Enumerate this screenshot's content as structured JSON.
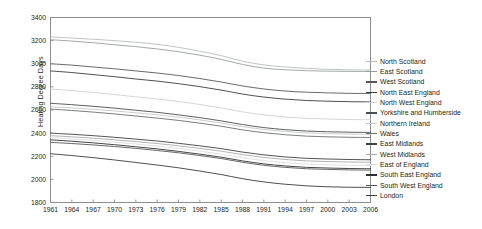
{
  "chart_data": {
    "type": "line",
    "title": "",
    "xlabel": "",
    "ylabel": "Heating Degree Days",
    "xlim": [
      1961,
      2006
    ],
    "ylim": [
      1800,
      3400
    ],
    "xticks": [
      1961,
      1964,
      1967,
      1970,
      1973,
      1976,
      1979,
      1982,
      1985,
      1988,
      1991,
      1994,
      1997,
      2000,
      2003,
      2006
    ],
    "yticks": [
      1800,
      2000,
      2200,
      2400,
      2600,
      2800,
      3000,
      3200,
      3400
    ],
    "grid": false,
    "legend_position": "right",
    "x": [
      1961,
      1964,
      1967,
      1970,
      1973,
      1976,
      1979,
      1982,
      1985,
      1988,
      1991,
      1994,
      1997,
      2000,
      2003,
      2006
    ],
    "series": [
      {
        "name": "North Scotland",
        "color": "#b9bcbe",
        "values": [
          3232,
          3222,
          3212,
          3200,
          3186,
          3168,
          3142,
          3108,
          3070,
          3022,
          2990,
          2972,
          2960,
          2952,
          2948,
          2946
        ]
      },
      {
        "name": "East Scotland",
        "color": "#9a9d9f",
        "values": [
          3208,
          3196,
          3182,
          3164,
          3148,
          3128,
          3104,
          3074,
          3038,
          2994,
          2962,
          2948,
          2940,
          2936,
          2934,
          2934
        ]
      },
      {
        "name": "West Scotland",
        "color": "#58595b",
        "values": [
          3000,
          2988,
          2972,
          2956,
          2938,
          2920,
          2898,
          2872,
          2842,
          2808,
          2782,
          2764,
          2754,
          2748,
          2744,
          2742
        ]
      },
      {
        "name": "North East England",
        "color": "#3b3c3e",
        "values": [
          2938,
          2924,
          2906,
          2888,
          2868,
          2850,
          2828,
          2802,
          2772,
          2738,
          2712,
          2694,
          2682,
          2676,
          2672,
          2670
        ]
      },
      {
        "name": "North West England",
        "color": "#cfd1d3",
        "values": [
          2782,
          2768,
          2752,
          2734,
          2714,
          2696,
          2674,
          2648,
          2618,
          2584,
          2558,
          2540,
          2528,
          2522,
          2518,
          2516
        ]
      },
      {
        "name": "Yorkshire and Humberside",
        "color": "#4c4d4f",
        "values": [
          2658,
          2646,
          2632,
          2616,
          2598,
          2580,
          2558,
          2534,
          2506,
          2474,
          2448,
          2430,
          2418,
          2412,
          2408,
          2406
        ]
      },
      {
        "name": "Northern Ireland",
        "color": "#c4c6c8",
        "values": [
          2628,
          2618,
          2606,
          2592,
          2576,
          2558,
          2538,
          2514,
          2488,
          2456,
          2432,
          2414,
          2402,
          2396,
          2392,
          2390
        ]
      },
      {
        "name": "Wales",
        "color": "#6d6e70",
        "values": [
          2608,
          2596,
          2582,
          2566,
          2548,
          2530,
          2510,
          2486,
          2460,
          2428,
          2404,
          2386,
          2374,
          2368,
          2364,
          2362
        ]
      },
      {
        "name": "East Midlands",
        "color": "#404142",
        "values": [
          2400,
          2390,
          2378,
          2364,
          2348,
          2332,
          2312,
          2290,
          2266,
          2236,
          2212,
          2194,
          2182,
          2176,
          2172,
          2170
        ]
      },
      {
        "name": "West Midlands",
        "color": "#a7a9ab",
        "values": [
          2378,
          2368,
          2356,
          2342,
          2326,
          2310,
          2290,
          2268,
          2244,
          2214,
          2190,
          2172,
          2160,
          2154,
          2150,
          2148
        ]
      },
      {
        "name": "East of England",
        "color": "#dcdddf",
        "values": [
          2362,
          2350,
          2338,
          2322,
          2306,
          2288,
          2268,
          2244,
          2218,
          2188,
          2162,
          2144,
          2132,
          2126,
          2122,
          2120
        ]
      },
      {
        "name": "South East England",
        "color": "#2f3031",
        "values": [
          2342,
          2330,
          2316,
          2300,
          2282,
          2264,
          2242,
          2218,
          2192,
          2160,
          2134,
          2116,
          2104,
          2098,
          2094,
          2092
        ]
      },
      {
        "name": "South West England",
        "color": "#555658",
        "values": [
          2320,
          2310,
          2298,
          2284,
          2268,
          2250,
          2230,
          2206,
          2180,
          2148,
          2122,
          2104,
          2092,
          2086,
          2082,
          2080
        ]
      },
      {
        "name": "London",
        "color": "#3a3b3d",
        "values": [
          2222,
          2206,
          2188,
          2168,
          2146,
          2124,
          2100,
          2072,
          2042,
          2006,
          1978,
          1958,
          1944,
          1936,
          1932,
          1930
        ]
      }
    ],
    "legend_entries": [
      "North Scotland",
      "East Scotland",
      "West Scotland",
      "North East England",
      "North West England",
      "Yorkshire and Humberside",
      "Northern Ireland",
      "Wales",
      "East Midlands",
      "West Midlands",
      "East of England",
      "South East England",
      "South West England",
      "London"
    ]
  },
  "axis": {
    "y_title": "Heating Degree Days"
  }
}
